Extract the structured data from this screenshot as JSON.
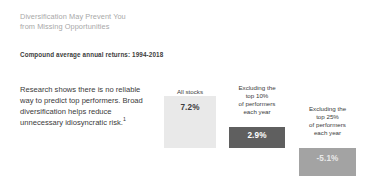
{
  "slide": {
    "title_line_1": "Diversification May Prevent You",
    "title_line_2": "from Missing Opportunities",
    "subtitle": "Compound average annual returns: 1994-2018",
    "body_text": "Research shows there is no reliable way to predict top performers. Broad diversification helps reduce unnecessary idiosyncratic risk.",
    "footnote_marker": "1"
  },
  "colors": {
    "title": "#a8a8a8",
    "text": "#3c3c3c",
    "bar_all_stocks": "#e9e9e9",
    "bar_excl_10": "#5f5f5f",
    "bar_excl_25": "#a3a3a3",
    "background": "#ffffff"
  },
  "chart_data": {
    "type": "bar",
    "title": "Compound average annual returns: 1994-2018",
    "xlabel": "",
    "ylabel": "",
    "categories": [
      "All stocks",
      "Excluding the top 10% of performers each year",
      "Excluding the top 25% of performers each year"
    ],
    "values": [
      7.2,
      2.9,
      -5.1
    ],
    "value_labels": [
      "7.2%",
      "2.9%",
      "-5.1%"
    ],
    "bar_colors": [
      "#e9e9e9",
      "#5f5f5f",
      "#a3a3a3"
    ],
    "grid": false,
    "legend": "none",
    "bars": [
      {
        "label": "All stocks",
        "caption_lines": [
          "All stocks"
        ],
        "value": 7.2,
        "value_label": "7.2%",
        "color": "#e9e9e9"
      },
      {
        "label": "Excluding the top 10% of performers each year",
        "caption_lines": [
          "Excluding the",
          "top 10%",
          "of performers",
          "each year"
        ],
        "value": 2.9,
        "value_label": "2.9%",
        "color": "#5f5f5f"
      },
      {
        "label": "Excluding the top 25% of performers each year",
        "caption_lines": [
          "Excluding the",
          "top 25%",
          "of performers",
          "each year"
        ],
        "value": -5.1,
        "value_label": "-5.1%",
        "color": "#a3a3a3"
      }
    ]
  }
}
